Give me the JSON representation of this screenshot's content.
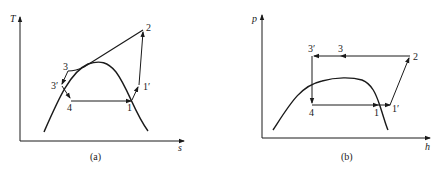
{
  "diagrams": [
    {
      "id": "a",
      "caption": "(a)",
      "axes": {
        "y_label": "T",
        "x_label": "s"
      },
      "points": {
        "p1": "1",
        "p1p": "1′",
        "p2": "2",
        "p3": "3",
        "p3p": "3′",
        "p4": "4"
      }
    },
    {
      "id": "b",
      "caption": "(b)",
      "axes": {
        "y_label": "p",
        "x_label": "h"
      },
      "points": {
        "p1": "1",
        "p1p": "1′",
        "p2": "2",
        "p3": "3",
        "p3p": "3′",
        "p4": "4"
      }
    }
  ],
  "colors": {
    "ink": "#1a1a1a",
    "background": "#ffffff"
  }
}
